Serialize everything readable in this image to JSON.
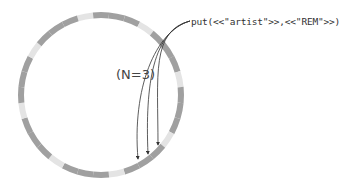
{
  "diagram": {
    "type": "hash-ring",
    "operation_label": "put(<<\"artist\">>,<<\"REM\">>)",
    "replication_label": "(N=3)",
    "ring": {
      "center": [
        101,
        95
      ],
      "radius": 80,
      "stroke_width": 6,
      "colors": {
        "dark": "#a0a0a0",
        "light": "#e4e4e4"
      },
      "segments": [
        "light",
        "dark",
        "dark",
        "dark",
        "light",
        "dark",
        "dark",
        "dark",
        "light",
        "dark",
        "dark",
        "dark",
        "light",
        "dark",
        "dark",
        "dark",
        "light",
        "dark",
        "dark",
        "dark",
        "light",
        "dark",
        "dark",
        "dark",
        "light",
        "dark",
        "dark",
        "dark",
        "light",
        "dark",
        "dark",
        "dark"
      ]
    },
    "arrows": [
      {
        "from": [
          190,
          21
        ],
        "to": [
          138,
          159
        ]
      },
      {
        "from": [
          190,
          21
        ],
        "to": [
          148,
          154
        ]
      },
      {
        "from": [
          190,
          21
        ],
        "to": [
          158,
          145
        ]
      }
    ]
  }
}
